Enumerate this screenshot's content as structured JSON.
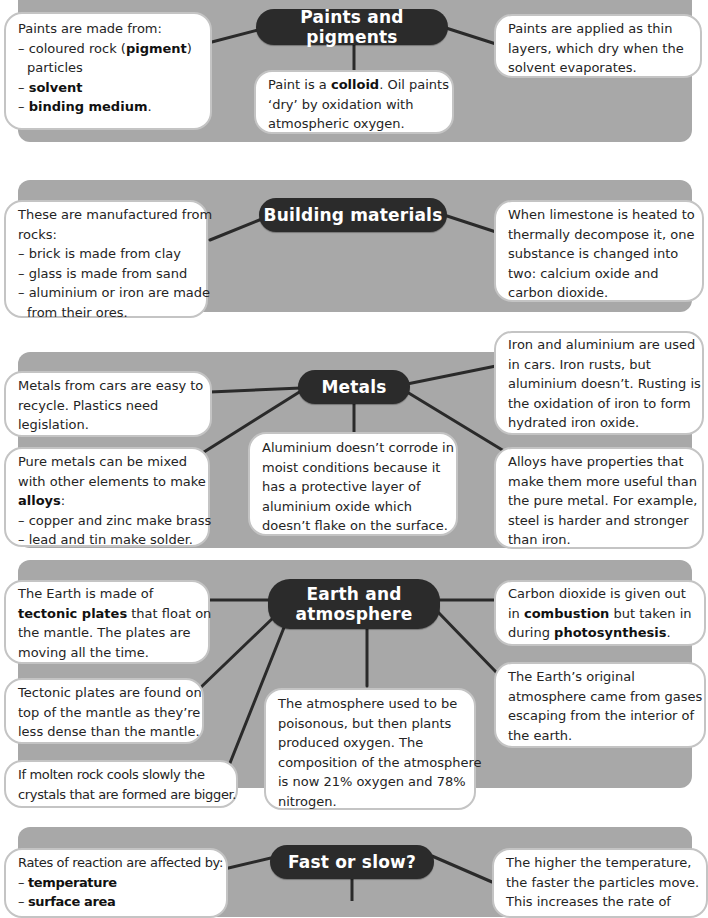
{
  "sections": [
    {
      "title": "Paints and pigments",
      "boxes": {
        "left": {
          "lines": [
            "Paints are made from:",
            "– coloured rock (",
            "pigment",
            ")",
            "particles",
            "– ",
            "solvent",
            "– ",
            "binding medium",
            "."
          ]
        },
        "center": {
          "p1": "Paint is a ",
          "b1": "colloid",
          "p2": ". Oil paints",
          "l2": "‘dry’ by oxidation with",
          "l3": "atmospheric oxygen."
        },
        "right": {
          "l1": "Paints are applied as thin",
          "l2": "layers, which dry when the",
          "l3": "solvent evaporates."
        }
      }
    },
    {
      "title": "Building materials",
      "boxes": {
        "left": {
          "l1": "These are manufactured from",
          "l2": "rocks:",
          "l3": "– brick is made from clay",
          "l4": "– glass is made from sand",
          "l5": "– aluminium or iron are made",
          "l6": "from their ores."
        },
        "right": {
          "l1": "When limestone is heated to",
          "l2": "thermally decompose it, one",
          "l3": "substance is changed into",
          "l4": "two: calcium oxide and",
          "l5": "carbon dioxide."
        }
      }
    },
    {
      "title": "Metals",
      "boxes": {
        "top_left": {
          "l1": "Metals from cars are easy to",
          "l2": "recycle. Plastics need",
          "l3": "legislation."
        },
        "bottom_left": {
          "l1": "Pure metals can be mixed",
          "l2": "with other elements to make",
          "b1": "alloys",
          "p1": ":",
          "l4": "– copper and zinc make brass",
          "l5": "– lead and tin make solder."
        },
        "center": {
          "l1": "Aluminium doesn’t corrode in",
          "l2": "moist conditions because it",
          "l3": "has a protective layer of",
          "l4": "aluminium oxide which",
          "l5": "doesn’t flake on the surface."
        },
        "top_right": {
          "l1": "Iron and aluminium are used",
          "l2": "in cars.  Iron rusts, but",
          "l3": "aluminium doesn’t. Rusting is",
          "l4": "the oxidation of iron to form",
          "l5": "hydrated iron oxide."
        },
        "bottom_right": {
          "l1": "Alloys have properties that",
          "l2": "make them more useful than",
          "l3": "the pure metal. For example,",
          "l4": "steel is harder and stronger",
          "l5": "than iron."
        }
      }
    },
    {
      "title_line1": "Earth and",
      "title_line2": "atmosphere",
      "boxes": {
        "top_left": {
          "l1": "The Earth is made of",
          "b1": "tectonic plates",
          "p1": " that float on",
          "l3": "the mantle. The plates are",
          "l4": "moving all the time."
        },
        "mid_left": {
          "l1": "Tectonic plates are found on",
          "l2": "top of the mantle as they’re",
          "l3": "less dense than the mantle."
        },
        "bottom_left": {
          "l1": "If molten rock cools slowly the",
          "l2": "crystals that are formed are bigger."
        },
        "center": {
          "l1": "The atmosphere used to be",
          "l2": "poisonous, but then plants",
          "l3": "produced oxygen. The",
          "l4": "composition of the atmosphere",
          "l5": "is now 21% oxygen and 78%",
          "l6": "nitrogen."
        },
        "top_right": {
          "l1": "Carbon dioxide is given out",
          "p1": "in ",
          "b1": "combustion",
          "p2": " but taken in",
          "p3": "during ",
          "b2": "photosynthesis",
          "p4": "."
        },
        "bottom_right": {
          "l1": "The Earth’s original",
          "l2": "atmosphere came from gases",
          "l3": "escaping from the interior of",
          "l4": "the earth."
        }
      }
    },
    {
      "title": "Fast or slow?",
      "boxes": {
        "left": {
          "l1": "Rates of reaction are affected by:",
          "dash": "– ",
          "b1": "temperature",
          "b2": "surface area"
        },
        "right": {
          "l1": "The higher the temperature,",
          "l2": "the faster the particles move.",
          "l3": "This increases the rate of"
        }
      }
    }
  ],
  "colors": {
    "panel": "#a8a8a8",
    "hub": "#2b2b2b",
    "hub_text": "#ffffff",
    "box_border": "#c4c4c4",
    "connector": "#2a2a2a"
  }
}
